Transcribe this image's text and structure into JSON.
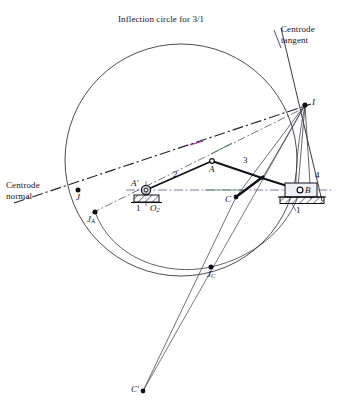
{
  "figure": {
    "title": "Inflection circle for 3/1",
    "colors": {
      "ink": "#1a1a22",
      "centrode_normal": "#23232e",
      "centrode_tangent": "#23232e",
      "circle": "#2a2a33",
      "link_line": "#101018",
      "slider_fill": "#e8e8ef",
      "hatch": "#2a2a33",
      "axis_dashdot": "#5a5a8c",
      "green_accent": "#2f7d32",
      "magenta_accent": "#a0208c"
    },
    "labels": {
      "title": "Inflection circle for 3/1",
      "centrode_tangent_line1": "Centrode",
      "centrode_tangent_line2": "tangent",
      "centrode_normal_line1": "Centrode",
      "centrode_normal_line2": "normal",
      "point_I": "I",
      "point_A": "A",
      "point_A_prime": "A′",
      "point_B": "B",
      "point_C": "C",
      "point_C_prime": "C′",
      "point_J": "J",
      "point_JA": "J",
      "point_JA_sub": "A",
      "point_JC": "J",
      "point_JC_sub": "C",
      "point_O2": "O",
      "point_O2_sub": "2",
      "link_2": "2",
      "link_3": "3",
      "link_4": "4",
      "ground_left": "1",
      "ground_right": "1",
      "ground_under_pivot": "1"
    },
    "geometry": {
      "inflection_circle": {
        "cx": 181,
        "cy": 160,
        "r": 116
      },
      "points": {
        "I": {
          "x": 305,
          "y": 105
        },
        "A": {
          "x": 212,
          "y": 161
        },
        "A_prime": {
          "x": 146,
          "y": 190
        },
        "B": {
          "x": 303,
          "y": 191
        },
        "C": {
          "x": 235,
          "y": 196
        },
        "C_prime": {
          "x": 144,
          "y": 390
        },
        "J": {
          "x": 78,
          "y": 190
        },
        "J_A": {
          "x": 95,
          "y": 212
        },
        "J_C": {
          "x": 211,
          "y": 267
        },
        "O2": {
          "x": 146,
          "y": 190
        },
        "coupler_pt": {
          "x": 262,
          "y": 178
        }
      }
    }
  }
}
